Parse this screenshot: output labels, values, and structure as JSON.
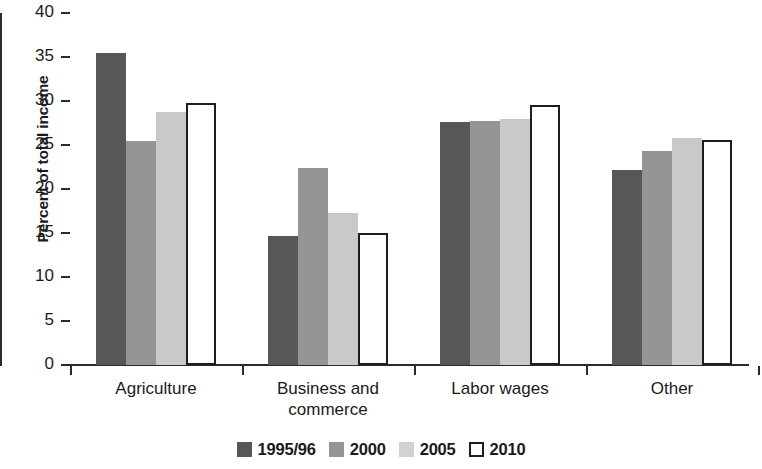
{
  "chart_data": {
    "type": "bar",
    "title": "",
    "subtitle": "",
    "xlabel": "",
    "ylabel": "Percent of total income",
    "ylim": [
      0,
      40
    ],
    "yticks": [
      0,
      5,
      10,
      15,
      20,
      25,
      30,
      35,
      40
    ],
    "ytick_labels": [
      "0",
      "5",
      "10",
      "15",
      "20",
      "25",
      "30",
      "35",
      "40"
    ],
    "grid": false,
    "legend_position": "bottom",
    "categories": [
      "Agriculture",
      "Business and\ncommerce",
      "Labor wages",
      "Other"
    ],
    "category_labels": [
      "Agriculture",
      "Business and commerce",
      "Labor wages",
      "Other"
    ],
    "series": [
      {
        "name": "1995/96",
        "color": "#575757",
        "values": [
          35.5,
          14.7,
          27.6,
          22.2
        ]
      },
      {
        "name": "2000",
        "color": "#959595",
        "values": [
          25.4,
          22.4,
          27.7,
          24.3
        ]
      },
      {
        "name": "2005",
        "color": "#c9c9c9",
        "values": [
          28.7,
          17.3,
          28.0,
          25.8
        ]
      },
      {
        "name": "2010",
        "color": "#ffffff",
        "values": [
          29.8,
          15.0,
          29.6,
          25.6
        ]
      }
    ]
  },
  "legend": {
    "items": [
      {
        "label": "1995/96",
        "swatch": "dark-gray-swatch"
      },
      {
        "label": "2000",
        "swatch": "medium-gray-swatch"
      },
      {
        "label": "2005",
        "swatch": "light-gray-swatch"
      },
      {
        "label": "2010",
        "swatch": "white-outline-swatch"
      }
    ]
  }
}
